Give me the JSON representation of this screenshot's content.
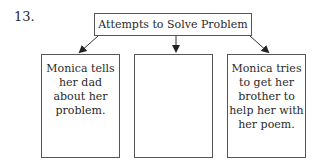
{
  "item_number": "13.",
  "diagram": {
    "root": {
      "label": "Attempts to Solve Problem"
    },
    "children": [
      {
        "label": "Monica tells her dad about her problem."
      },
      {
        "label": ""
      },
      {
        "label": "Monica tries to get her brother to help her with her poem."
      }
    ]
  }
}
